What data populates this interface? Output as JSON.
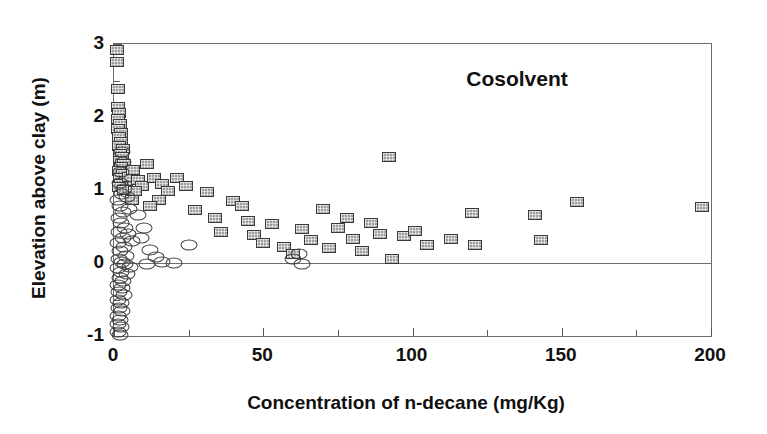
{
  "chart_data": {
    "type": "scatter",
    "title": "",
    "annotation": "Cosolvent",
    "xlabel": "Concentration of n-decane (mg/Kg)",
    "ylabel": "Elevation above clay (m)",
    "xlim": [
      0,
      200
    ],
    "ylim": [
      -1,
      3
    ],
    "xticks": [
      0,
      50,
      100,
      150,
      200
    ],
    "xtick_labels": [
      "0",
      "50",
      "100",
      "150",
      "200"
    ],
    "xminorticks": [
      25,
      75,
      125,
      175
    ],
    "yticks": [
      -1,
      0,
      1,
      2,
      3
    ],
    "ytick_labels": [
      "-1",
      "0",
      "1",
      "2",
      "3"
    ],
    "yminorticks": [
      -0.5,
      0.5,
      1.5,
      2.5
    ],
    "grid": false,
    "legend": "none",
    "reference_lines": [
      {
        "axis": "y",
        "value": 0
      }
    ],
    "series": [
      {
        "name": "squares",
        "marker": "square",
        "marker_color": "#9e9e9e",
        "marker_edge_color": "#3a3a3a",
        "points": [
          [
            1.0,
            2.92
          ],
          [
            1.0,
            2.75
          ],
          [
            1.2,
            2.38
          ],
          [
            1.4,
            2.14
          ],
          [
            1.6,
            2.05
          ],
          [
            1.3,
            1.97
          ],
          [
            2.0,
            1.9
          ],
          [
            1.5,
            1.83
          ],
          [
            2.4,
            1.78
          ],
          [
            1.8,
            1.72
          ],
          [
            2.2,
            1.66
          ],
          [
            1.6,
            1.6
          ],
          [
            3.0,
            1.56
          ],
          [
            2.0,
            1.5
          ],
          [
            2.6,
            1.45
          ],
          [
            1.9,
            1.4
          ],
          [
            3.4,
            1.36
          ],
          [
            2.3,
            1.31
          ],
          [
            1.7,
            1.26
          ],
          [
            3.0,
            1.22
          ],
          [
            2.1,
            1.17
          ],
          [
            4.0,
            1.13
          ],
          [
            2.5,
            1.08
          ],
          [
            1.8,
            1.04
          ],
          [
            3.2,
            1.0
          ],
          [
            5.0,
            1.18
          ],
          [
            6.5,
            1.28
          ],
          [
            8.0,
            1.14
          ],
          [
            9.5,
            1.05
          ],
          [
            7.0,
            0.98
          ],
          [
            6.0,
            0.86
          ],
          [
            11.0,
            1.36
          ],
          [
            13.5,
            1.16
          ],
          [
            16.0,
            1.08
          ],
          [
            18.0,
            0.99
          ],
          [
            15.0,
            0.86
          ],
          [
            12.0,
            0.78
          ],
          [
            21.0,
            1.16
          ],
          [
            24.0,
            1.05
          ],
          [
            27.0,
            0.72
          ],
          [
            31.0,
            0.97
          ],
          [
            34.0,
            0.62
          ],
          [
            36.0,
            0.42
          ],
          [
            40.0,
            0.85
          ],
          [
            43.0,
            0.78
          ],
          [
            45.0,
            0.57
          ],
          [
            47.0,
            0.38
          ],
          [
            50.0,
            0.28
          ],
          [
            53.0,
            0.53
          ],
          [
            57.0,
            0.22
          ],
          [
            60.0,
            0.13
          ],
          [
            63.0,
            0.46
          ],
          [
            66.0,
            0.32
          ],
          [
            70.0,
            0.74
          ],
          [
            72.0,
            0.2
          ],
          [
            75.0,
            0.48
          ],
          [
            78.0,
            0.62
          ],
          [
            80.0,
            0.33
          ],
          [
            83.0,
            0.17
          ],
          [
            86.0,
            0.55
          ],
          [
            89.0,
            0.4
          ],
          [
            92.0,
            1.45
          ],
          [
            93.0,
            0.05
          ],
          [
            97.0,
            0.37
          ],
          [
            101.0,
            0.44
          ],
          [
            105.0,
            0.25
          ],
          [
            113.0,
            0.33
          ],
          [
            120.0,
            0.68
          ],
          [
            121.0,
            0.25
          ],
          [
            141.0,
            0.66
          ],
          [
            143.0,
            0.32
          ],
          [
            155.0,
            0.84
          ],
          [
            197.0,
            0.77
          ]
        ]
      },
      {
        "name": "ellipses",
        "marker": "ellipse",
        "marker_color": "none",
        "marker_edge_color": "#3f3f3f",
        "points": [
          [
            2.6,
            1.52
          ],
          [
            3.0,
            1.38
          ],
          [
            2.2,
            1.24
          ],
          [
            1.9,
            1.1
          ],
          [
            3.4,
            1.02
          ],
          [
            2.8,
            0.94
          ],
          [
            1.5,
            0.86
          ],
          [
            4.2,
            0.9
          ],
          [
            2.0,
            0.78
          ],
          [
            3.0,
            0.7
          ],
          [
            1.6,
            0.62
          ],
          [
            5.0,
            0.74
          ],
          [
            2.4,
            0.55
          ],
          [
            3.8,
            0.48
          ],
          [
            1.8,
            0.42
          ],
          [
            2.9,
            0.34
          ],
          [
            4.6,
            0.4
          ],
          [
            1.4,
            0.28
          ],
          [
            3.3,
            0.22
          ],
          [
            6.0,
            0.3
          ],
          [
            2.1,
            0.16
          ],
          [
            4.0,
            0.1
          ],
          [
            1.7,
            0.05
          ],
          [
            2.7,
            0.02
          ],
          [
            3.6,
            -0.02
          ],
          [
            1.3,
            -0.07
          ],
          [
            5.2,
            -0.05
          ],
          [
            2.3,
            -0.12
          ],
          [
            4.4,
            -0.15
          ],
          [
            1.9,
            -0.2
          ],
          [
            3.1,
            -0.24
          ],
          [
            1.5,
            -0.3
          ],
          [
            2.6,
            -0.34
          ],
          [
            1.8,
            -0.4
          ],
          [
            3.4,
            -0.44
          ],
          [
            1.4,
            -0.5
          ],
          [
            2.2,
            -0.55
          ],
          [
            1.6,
            -0.62
          ],
          [
            2.8,
            -0.66
          ],
          [
            1.3,
            -0.72
          ],
          [
            2.0,
            -0.78
          ],
          [
            1.5,
            -0.84
          ],
          [
            2.5,
            -0.88
          ],
          [
            1.2,
            -0.94
          ],
          [
            1.9,
            -0.98
          ],
          [
            8.0,
            0.66
          ],
          [
            10.0,
            0.48
          ],
          [
            9.0,
            0.34
          ],
          [
            12.0,
            0.18
          ],
          [
            14.0,
            0.08
          ],
          [
            11.0,
            -0.02
          ],
          [
            16.0,
            0.02
          ],
          [
            20.0,
            0.0
          ],
          [
            25.0,
            0.25
          ],
          [
            60.0,
            0.05
          ],
          [
            63.0,
            -0.02
          ],
          [
            62.0,
            0.12
          ]
        ]
      }
    ]
  }
}
